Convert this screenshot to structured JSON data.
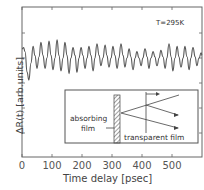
{
  "chart_data": {
    "type": "line",
    "title": "",
    "xlabel": "Time delay [psec]",
    "ylabel": "ΔR(t)  [arb.units]",
    "xlim": [
      0,
      600
    ],
    "x_ticks": [
      0,
      100,
      200,
      300,
      400,
      500
    ],
    "x_tick_labels": [
      "0",
      "100",
      "200",
      "300",
      "400",
      "500"
    ],
    "y_ticks_count": 5,
    "y_tick_labels": [],
    "grid": false,
    "annotation": "T=295K",
    "series": [
      {
        "name": "reflectivity change",
        "x": [
          0,
          5,
          10,
          17,
          23,
          30,
          37,
          43,
          50,
          57,
          63,
          70,
          77,
          83,
          90,
          97,
          103,
          110,
          117,
          123,
          130,
          137,
          143,
          150,
          157,
          163,
          170,
          177,
          183,
          190,
          197,
          203,
          210,
          217,
          223,
          230,
          237,
          243,
          250,
          257,
          263,
          270,
          277,
          283,
          290,
          297,
          303,
          310,
          317,
          323,
          330,
          337,
          343,
          350,
          357,
          363,
          370,
          377,
          383,
          390,
          397,
          403,
          410,
          417,
          423,
          430,
          437,
          443,
          450,
          457,
          463,
          470,
          477,
          483,
          490,
          497,
          503,
          510,
          517,
          523,
          530,
          537,
          543,
          550,
          557,
          563,
          570,
          577,
          583,
          590,
          597,
          600
        ],
        "y": [
          0.35,
          0.4,
          0.25,
          -0.55,
          -0.85,
          -0.2,
          0.45,
          0.1,
          -0.4,
          0.05,
          0.6,
          0.1,
          -0.4,
          0.0,
          0.65,
          0.1,
          -0.45,
          0.0,
          0.7,
          0.1,
          -0.5,
          0.0,
          0.6,
          0.1,
          -0.6,
          0.0,
          0.4,
          0.1,
          -0.55,
          0.0,
          0.4,
          0.1,
          -0.4,
          0.0,
          0.45,
          0.1,
          -0.5,
          0.0,
          0.55,
          0.1,
          -0.3,
          0.0,
          0.5,
          0.1,
          -0.35,
          0.0,
          0.45,
          0.1,
          -0.4,
          0.0,
          0.55,
          0.1,
          -0.35,
          0.0,
          0.35,
          0.05,
          -0.45,
          0.0,
          0.25,
          0.0,
          -0.3,
          0.0,
          0.35,
          0.05,
          -0.4,
          0.0,
          0.25,
          0.05,
          -0.3,
          0.0,
          0.3,
          0.05,
          -0.4,
          0.0,
          0.55,
          0.05,
          -0.5,
          0.0,
          0.45,
          0.05,
          -0.35,
          0.0,
          0.45,
          0.05,
          -0.45,
          0.0,
          0.4,
          0.05,
          -0.3,
          0.0,
          0.2,
          0.1
        ]
      }
    ],
    "inset": {
      "labels": [
        "absorbing film",
        "transparent film"
      ],
      "description": "Schematic: absorbing film (hatched) on transparent film with acoustic echo ray diagram and probe arrows"
    }
  },
  "axes": {
    "x_title": "Time delay [psec]",
    "y_title": "ΔR(t)  [arb.units]",
    "temperature": "T=295K",
    "x_tick_labels": [
      "0",
      "100",
      "200",
      "300",
      "400",
      "500"
    ]
  },
  "inset": {
    "absorbing_line1": "absorbing",
    "absorbing_line2": "film",
    "transparent": "transparent film"
  }
}
